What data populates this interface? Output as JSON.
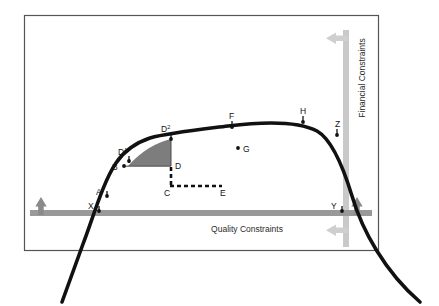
{
  "figure": {
    "type": "diagram",
    "kind": "conceptual-curve-diagram",
    "frame": {
      "x": 24,
      "y": 15,
      "width": 354,
      "height": 235,
      "border_color": "#555555"
    }
  },
  "colors": {
    "curve": "#111111",
    "frame_border": "#555555",
    "quality_bar": "#999999",
    "financial_bar": "#c9c9c9",
    "dark_arrow": "#8a8a8a",
    "light_arrow": "#cfcfcf",
    "shaded_region": "#7d7d7d",
    "point_marker": "#111111",
    "label_text": "#111111",
    "background": "#ffffff"
  },
  "constraints": {
    "quality": {
      "label": "Quality Constraints",
      "orientation": "horizontal",
      "bar": {
        "x1": 30,
        "x2": 372,
        "y": 213,
        "thickness": 6
      },
      "label_pos": {
        "x": 247,
        "y": 232
      },
      "arrows": [
        {
          "name": "quality-arrow-left",
          "direction": "up",
          "x": 41,
          "y": 207,
          "color": "#8a8a8a"
        },
        {
          "name": "quality-arrow-right",
          "direction": "up",
          "x": 357,
          "y": 207,
          "color": "#8a8a8a"
        }
      ]
    },
    "financial": {
      "label": "Financial Constraints",
      "orientation": "vertical",
      "bar": {
        "x": 346,
        "y1": 30,
        "y2": 247,
        "thickness": 6
      },
      "label_pos": {
        "x": 365,
        "y": 78
      },
      "arrows": [
        {
          "name": "financial-arrow-top",
          "direction": "left",
          "x": 340,
          "y": 38,
          "color": "#cfcfcf"
        },
        {
          "name": "financial-arrow-bottom",
          "direction": "left",
          "x": 340,
          "y": 230,
          "color": "#cfcfcf"
        }
      ]
    }
  },
  "curve": {
    "name": "performance-curve",
    "stroke_width": 3.6,
    "path": "M 62 302 L 83 244 C 93 218 103 182 116 163 C 124 151 135 143 150 138 C 168 133 196 130 228 126 C 268 121 300 122 317 131 C 331 139 342 163 352 196 C 362 230 385 272 420 302"
  },
  "points": [
    {
      "id": "X",
      "label": "X",
      "x": 99,
      "y": 211,
      "label_dx": -8,
      "label_dy": -3,
      "marker": "tick-dot"
    },
    {
      "id": "A",
      "label": "A",
      "x": 107,
      "y": 196,
      "label_dx": -9,
      "label_dy": -2,
      "marker": "tick-dot"
    },
    {
      "id": "B",
      "label": "B",
      "x": 124,
      "y": 167,
      "label_dx": -10,
      "label_dy": 2,
      "marker": "tick-dot"
    },
    {
      "id": "D1",
      "label": "D",
      "sup": "1",
      "x": 128,
      "y": 161,
      "label_dx": -8,
      "label_dy": -7,
      "marker": "tick-dot"
    },
    {
      "id": "D2",
      "label": "D",
      "sup": "2",
      "x": 171,
      "y": 139,
      "label_dx": -9,
      "label_dy": -8,
      "marker": "tick-dot"
    },
    {
      "id": "D",
      "label": "D",
      "x": 171,
      "y": 166,
      "label_dx": 4,
      "label_dy": 3,
      "marker": "none"
    },
    {
      "id": "C",
      "label": "C",
      "x": 171,
      "y": 186,
      "label_dx": -9,
      "label_dy": 9,
      "marker": "none"
    },
    {
      "id": "E",
      "label": "E",
      "x": 222,
      "y": 186,
      "label_dx": 2,
      "label_dy": 9,
      "marker": "none"
    },
    {
      "id": "F",
      "label": "F",
      "x": 232,
      "y": 127,
      "label_dx": -2,
      "label_dy": -6,
      "marker": "tick-dot"
    },
    {
      "id": "G",
      "label": "G",
      "x": 240,
      "y": 148,
      "label_dx": 4,
      "label_dy": 3,
      "marker": "dot"
    },
    {
      "id": "H",
      "label": "H",
      "x": 303,
      "y": 122,
      "label_dx": -1,
      "label_dy": -6,
      "marker": "tick-dot"
    },
    {
      "id": "Y",
      "label": "Y",
      "x": 342,
      "y": 211,
      "label_dx": -9,
      "label_dy": -3,
      "marker": "tick-dot"
    },
    {
      "id": "Z",
      "label": "Z",
      "x": 341,
      "y": 134,
      "label_dx": -3,
      "label_dy": -6,
      "marker": "tick-dot"
    }
  ],
  "shaded_region": {
    "name": "efficiency-gain-area",
    "fill": "#7d7d7d",
    "path": "M 128 166 L 171 166 L 171 139 C 157 142 141 151 128 166 Z"
  },
  "guides": [
    {
      "name": "baseline-b-to-d",
      "type": "solid-thin",
      "x1": 124,
      "y1": 166,
      "x2": 171,
      "y2": 166
    },
    {
      "name": "guide-d2-to-d",
      "type": "solid-thin",
      "x1": 171,
      "y1": 139,
      "x2": 171,
      "y2": 166
    },
    {
      "name": "guide-d-to-c",
      "type": "dashed",
      "x1": 171,
      "y1": 167,
      "x2": 171,
      "y2": 186
    },
    {
      "name": "guide-c-to-e",
      "type": "dashed",
      "x1": 171,
      "y1": 186,
      "x2": 222,
      "y2": 186
    }
  ]
}
